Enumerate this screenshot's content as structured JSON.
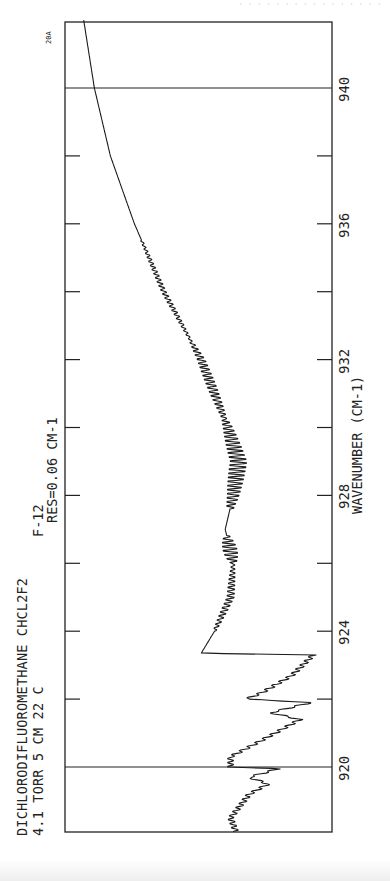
{
  "header": {
    "faint_text": "· · ·   · · ·  · ·   · · · · · · · ·"
  },
  "labels": {
    "title_line": "DICHLORODIFLUOROMETHANE CHCL2F2",
    "code": "F-12",
    "conditions": "4.1 TORR  5 CM  22 C",
    "resolution": "RES=0.06 CM-1",
    "plate_id": "20A"
  },
  "chart_data": {
    "type": "line",
    "subtitle": "4.1 TORR  5 CM  22 C   RES=0.06 CM-1",
    "plate_id": "20A",
    "xlabel": "WAVENUMBER (CM-1)",
    "ylabel": "",
    "orientation": "rotated 90° counter-clockwise (wavenumber runs bottom-to-top)",
    "xlim": [
      918.1,
      942.0
    ],
    "ylim": [
      0,
      1
    ],
    "x_ticks": [
      920,
      922,
      924,
      926,
      928,
      930,
      932,
      934,
      936,
      938,
      940
    ],
    "x_tick_labels": [
      "920",
      "924",
      "928",
      "932",
      "936",
      "940"
    ],
    "calibration_lines": [
      920,
      940
    ],
    "grid": false,
    "legend": null,
    "series": [
      {
        "name": "CHCl2F2 absorption spectrum (relative pen deflection)",
        "x": [
          918.1,
          918.5,
          919.2,
          919.5,
          919.7,
          919.95,
          920.0,
          920.3,
          920.8,
          921.4,
          921.6,
          921.9,
          922.0,
          922.2,
          922.7,
          923.3,
          923.35,
          924.0,
          925.0,
          926.0,
          927.0,
          928.0,
          929.0,
          930.0,
          932.0,
          934.0,
          936.0,
          938.0,
          940.0,
          942.0
        ],
        "values": [
          0.64,
          0.62,
          0.69,
          0.76,
          0.69,
          0.8,
          0.62,
          0.62,
          0.74,
          0.88,
          0.77,
          0.92,
          0.68,
          0.74,
          0.85,
          0.93,
          0.51,
          0.56,
          0.62,
          0.63,
          0.6,
          0.63,
          0.65,
          0.61,
          0.51,
          0.37,
          0.26,
          0.17,
          0.11,
          0.07
        ]
      }
    ],
    "rotational_fine_structure": [
      {
        "from": 924.0,
        "to": 926.0,
        "amplitude": 0.015
      },
      {
        "from": 926.0,
        "to": 926.8,
        "amplitude": 0.03
      },
      {
        "from": 927.6,
        "to": 930.2,
        "amplitude": 0.035
      },
      {
        "from": 930.2,
        "to": 932.5,
        "amplitude": 0.02
      },
      {
        "from": 932.5,
        "to": 935.5,
        "amplitude": 0.01
      }
    ]
  }
}
